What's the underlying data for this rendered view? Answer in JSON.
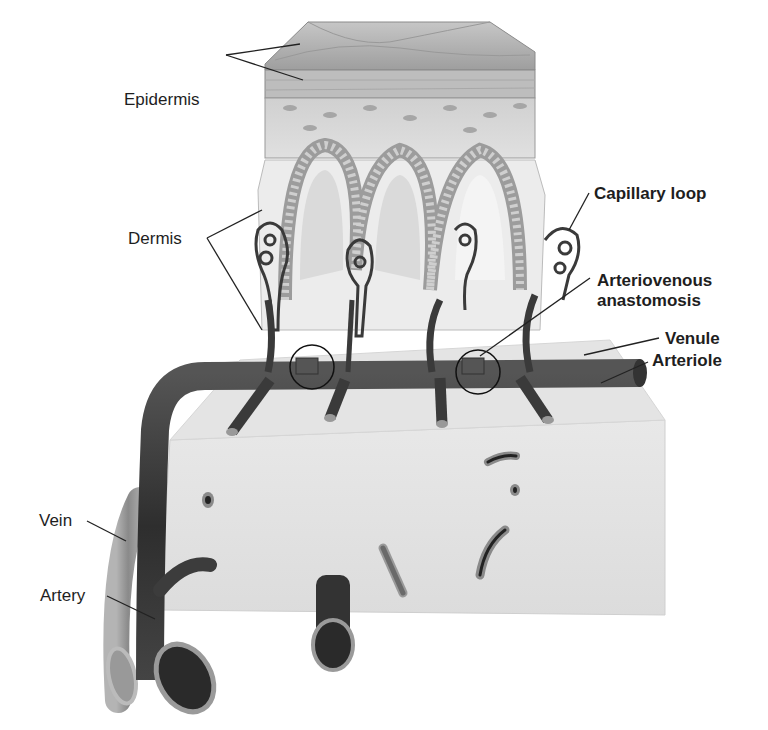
{
  "figure": {
    "labels": {
      "epidermis": "Epidermis",
      "dermis": "Dermis",
      "capillary_loop": "Capillary loop",
      "arteriovenous_1": "Arteriovenous",
      "arteriovenous_2": "anastomosis",
      "venule": "Venule",
      "arteriole": "Arteriole",
      "vein": "Vein",
      "artery": "Artery"
    },
    "colors": {
      "background": "#ffffff",
      "label_text": "#1e1e1e",
      "epidermis_top": "#b8b8b8",
      "epidermis_cells": "#d4d4d4",
      "dermis": "#e6e6e6",
      "subcutis": "#e2e2e2",
      "artery": "#3a3a3a",
      "vein": "#9a9a9a",
      "leader_line": "#222222"
    }
  }
}
